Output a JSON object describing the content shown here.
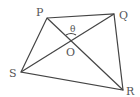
{
  "diagram": {
    "type": "quadrilateral-with-diagonals",
    "vertices": {
      "P": {
        "label": "P",
        "x": 47,
        "y": 18
      },
      "Q": {
        "label": "Q",
        "x": 114,
        "y": 14
      },
      "R": {
        "label": "R",
        "x": 123,
        "y": 90
      },
      "S": {
        "label": "S",
        "x": 21,
        "y": 72
      }
    },
    "intersection": {
      "label": "O"
    },
    "angle": {
      "label": "θ",
      "between": [
        "OP",
        "OQ"
      ]
    },
    "edges": [
      "PQ",
      "QR",
      "RS",
      "SP"
    ],
    "diagonals": [
      "PR",
      "QS"
    ],
    "colors": {
      "line": "#444444",
      "text": "#555555",
      "background": "#ffffff"
    }
  }
}
